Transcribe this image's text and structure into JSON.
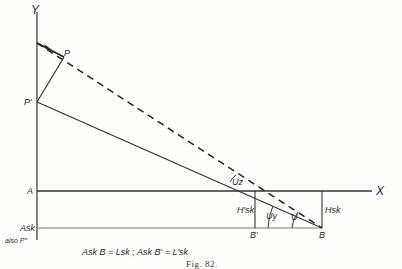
{
  "figure": {
    "caption": "Fig. 82.",
    "equation": "Ask B = Lsk ;  Ask B′ = L′sk",
    "colors": {
      "ink": "#2a2a2a",
      "background": "#fdfdfc",
      "lower_line": "#6a8a5a"
    }
  },
  "labels": {
    "y_axis": "Y",
    "x_axis": "X",
    "P": "P",
    "P_prime": "P′",
    "A": "A",
    "Ask": "Ask",
    "also_P2": "also P″",
    "B": "B",
    "B_prime": "B′",
    "H_sk": "Hsk",
    "H_sk_prime": "H′sk",
    "U": "U",
    "U_y": "Uy",
    "U_z": "Uz"
  },
  "geometry": {
    "y_axis_x": 37,
    "x_axis_y": 191,
    "ask_line_y": 228,
    "B": [
      322,
      228
    ],
    "B_prime": [
      255,
      228
    ],
    "P": [
      64,
      57
    ],
    "P_prime": [
      37,
      102
    ],
    "arrow_start": [
      37,
      43
    ]
  }
}
